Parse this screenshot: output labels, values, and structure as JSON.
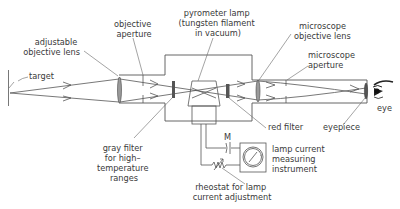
{
  "diagram": {
    "labels": {
      "target": "target",
      "adjustable_objective_lens": [
        "adjustable",
        "objective lens"
      ],
      "objective_aperture": [
        "objective",
        "aperture"
      ],
      "pyrometer_lamp": [
        "pyrometer lamp",
        "(tungsten filament",
        "in vacuum)"
      ],
      "microscope_objective_lens": [
        "microscope",
        "objective lens"
      ],
      "microscope_aperture": [
        "microscope",
        "aperture"
      ],
      "eye": "eye",
      "gray_filter": [
        "gray filter",
        "for high–",
        "temperature",
        "ranges"
      ],
      "red_filter": "red filter",
      "eyepiece": "eyepiece",
      "lamp_current_instrument": [
        "lamp current",
        "measuring",
        "instrument"
      ],
      "rheostat": [
        "rheostat for lamp",
        "current adjustment"
      ]
    },
    "components": [
      "target",
      "adjustable-objective-lens",
      "objective-aperture",
      "gray-filter",
      "pyrometer-lamp",
      "red-filter",
      "microscope-objective-lens",
      "microscope-aperture",
      "eyepiece",
      "eye",
      "lamp-current-measuring-instrument",
      "rheostat",
      "battery"
    ],
    "colors": {
      "line": "#555555",
      "text": "#3a3a3a",
      "lens_fill": "#9a9a9a",
      "filter_fill": "#555555",
      "background": "#ffffff"
    }
  }
}
